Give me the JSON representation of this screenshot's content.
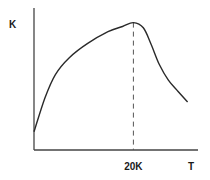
{
  "chart_data": {
    "type": "line",
    "title": "",
    "xlabel": "T",
    "ylabel": "K",
    "xlim": [
      0,
      33
    ],
    "ylim": [
      0,
      1
    ],
    "grid": false,
    "legend": "none",
    "x_ticks": [
      {
        "value": 20,
        "label": "20K"
      }
    ],
    "series": [
      {
        "name": "K(T)",
        "x": [
          0,
          2.2,
          4.3,
          7.1,
          10.8,
          14.9,
          17.8,
          20.0,
          22.0,
          23.6,
          25.2,
          27.0,
          29.0,
          30.9
        ],
        "y": [
          0.14,
          0.4,
          0.58,
          0.71,
          0.82,
          0.91,
          0.95,
          0.98,
          0.94,
          0.81,
          0.66,
          0.54,
          0.45,
          0.37
        ]
      }
    ],
    "annotations": [
      {
        "type": "vertical-dashed-line",
        "x": 20,
        "from_y": 0,
        "to_y": 0.98,
        "label": "20K"
      }
    ]
  }
}
